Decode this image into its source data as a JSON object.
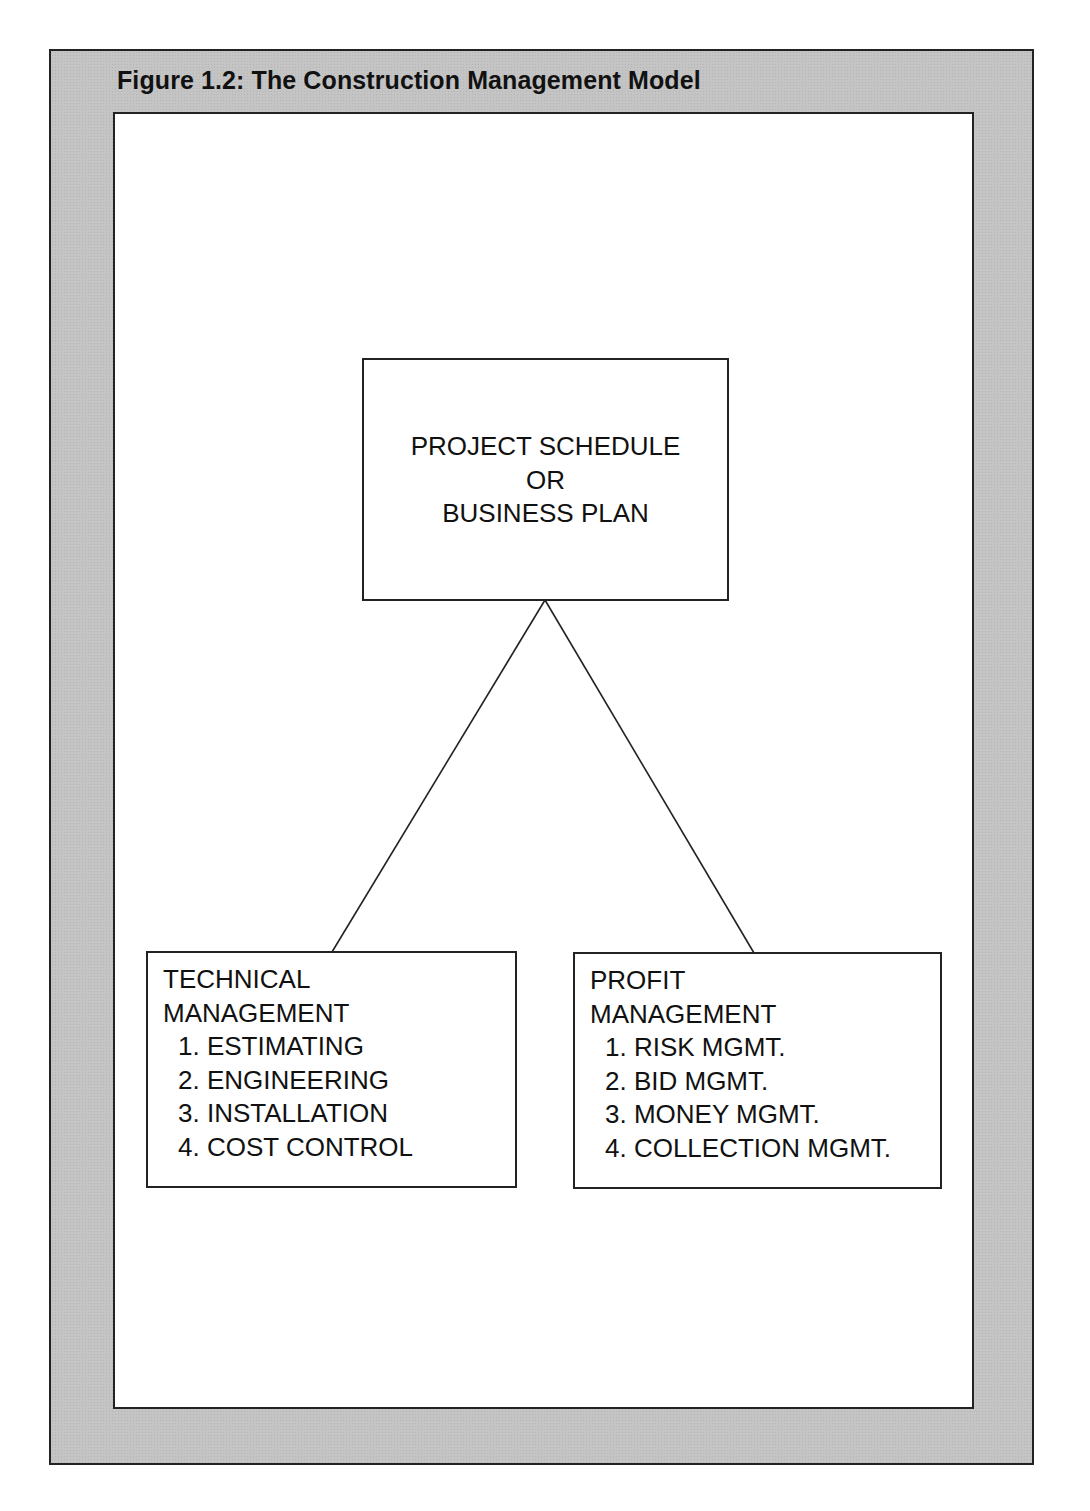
{
  "figure": {
    "title": "Figure 1.2: The Construction Management Model"
  },
  "top_box": {
    "lines": [
      "PROJECT SCHEDULE",
      "OR",
      "BUSINESS PLAN"
    ]
  },
  "left_box": {
    "heading": [
      "TECHNICAL",
      "MANAGEMENT"
    ],
    "items": [
      "1. ESTIMATING",
      "2. ENGINEERING",
      "3. INSTALLATION",
      "4. COST CONTROL"
    ]
  },
  "right_box": {
    "heading": [
      "PROFIT",
      "MANAGEMENT"
    ],
    "items": [
      "1. RISK MGMT.",
      "2. BID MGMT.",
      "3. MONEY MGMT.",
      "4. COLLECTION MGMT."
    ]
  },
  "colors": {
    "frame_gray": "#c4c4c4",
    "line": "#222222",
    "panel": "#ffffff"
  }
}
